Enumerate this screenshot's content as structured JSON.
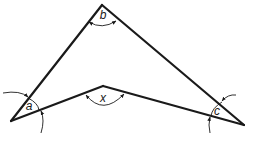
{
  "diagram": {
    "type": "geometry-arrowhead-quadrilateral",
    "vertices": {
      "left": {
        "x": 11,
        "y": 121
      },
      "top": {
        "x": 102,
        "y": 5
      },
      "right": {
        "x": 244,
        "y": 125
      },
      "reflex": {
        "x": 103,
        "y": 86
      }
    },
    "angles": [
      {
        "id": "a",
        "label": "a",
        "vertex": "left"
      },
      {
        "id": "b",
        "label": "b",
        "vertex": "top"
      },
      {
        "id": "c",
        "label": "c",
        "vertex": "right"
      },
      {
        "id": "x",
        "label": "x",
        "vertex": "reflex"
      }
    ],
    "stroke_color": "#1a1a1a",
    "background": "#ffffff"
  }
}
